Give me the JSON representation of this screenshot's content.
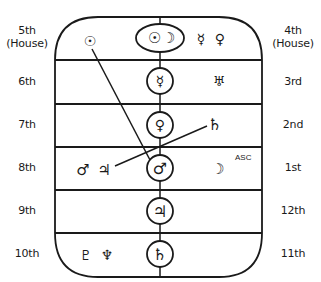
{
  "diagram": {
    "houses_left": [
      {
        "label": "5th",
        "sub": "(House)"
      },
      {
        "label": "6th"
      },
      {
        "label": "7th"
      },
      {
        "label": "8th"
      },
      {
        "label": "9th"
      },
      {
        "label": "10th"
      }
    ],
    "houses_right": [
      {
        "label": "4th",
        "sub": "(House)"
      },
      {
        "label": "3rd"
      },
      {
        "label": "2nd"
      },
      {
        "label": "1st"
      },
      {
        "label": "12th"
      },
      {
        "label": "11th"
      }
    ],
    "center_column": [
      {
        "row": 1,
        "symbols": "☉ ☽",
        "names": [
          "sun-icon",
          "moon-icon"
        ]
      },
      {
        "row": 2,
        "symbols": "☿",
        "names": [
          "mercury-icon"
        ]
      },
      {
        "row": 3,
        "symbols": "♀",
        "names": [
          "venus-icon"
        ]
      },
      {
        "row": 4,
        "symbols": "♂",
        "names": [
          "mars-icon"
        ]
      },
      {
        "row": 5,
        "symbols": "♃",
        "names": [
          "jupiter-icon"
        ]
      },
      {
        "row": 6,
        "symbols": "♄",
        "names": [
          "saturn-icon"
        ]
      }
    ],
    "left_placements": {
      "row1": "☉",
      "row4": "♂ ♃",
      "row6": "♇ ♆"
    },
    "right_placements": {
      "row1": "☿ ♀",
      "row2": "♅",
      "row3": "♄",
      "row4": "☽",
      "row4_annotation": "ASC"
    },
    "sun": "☉",
    "moon": "☽",
    "mercury": "☿",
    "venus": "♀",
    "mars": "♂",
    "jupiter": "♃",
    "saturn": "♄",
    "uranus": "♅",
    "neptune": "♆",
    "pluto": "♇",
    "asc": "ASC"
  }
}
